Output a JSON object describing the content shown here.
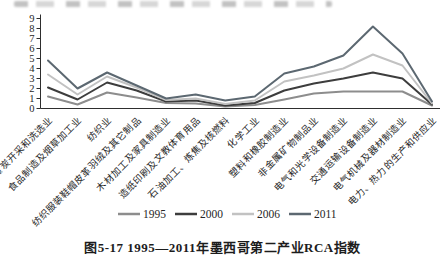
{
  "figure": {
    "caption": "图5-17 1995—2011年墨西哥第二产业RCA指数"
  },
  "chart_data": {
    "type": "line",
    "title": "",
    "xlabel": "",
    "ylabel": "",
    "ylim": [
      0,
      9
    ],
    "yticks": [
      0,
      1,
      2,
      3,
      4,
      5,
      6,
      7,
      8,
      9
    ],
    "grid": false,
    "legend_position": "bottom",
    "axis_color": "#2e2e2e",
    "categories": [
      "煤炭开采和洗选业",
      "食品制造及烟草加工业",
      "纺织业",
      "纺织服装鞋帽皮革羽绒及其它制品",
      "木材加工及家具制造业",
      "造纸印刷及文教体育用品",
      "石油加工、炼焦及核燃料",
      "化学工业",
      "塑料和橡胶制造业",
      "非金属矿物制品业",
      "电气和光学设备制造业",
      "交通运输设备制造业",
      "电气机械及器材制造业",
      "电力、热力的生产和供应业"
    ],
    "series": [
      {
        "name": "1995",
        "color": "#8d8d8d",
        "values": [
          1.2,
          0.4,
          1.6,
          1.1,
          0.55,
          0.5,
          0.2,
          0.35,
          0.9,
          1.5,
          1.7,
          1.7,
          1.7,
          0.3
        ]
      },
      {
        "name": "2000",
        "color": "#3d3d3d",
        "values": [
          2.1,
          0.9,
          2.6,
          1.8,
          0.7,
          0.8,
          0.3,
          0.55,
          1.8,
          2.5,
          3.0,
          3.6,
          3.0,
          0.4
        ]
      },
      {
        "name": "2006",
        "color": "#c2c2c2",
        "values": [
          3.4,
          1.4,
          3.2,
          2.1,
          0.85,
          1.0,
          0.45,
          0.8,
          2.7,
          3.3,
          4.0,
          5.4,
          4.3,
          0.5
        ]
      },
      {
        "name": "2011",
        "color": "#5c6871",
        "values": [
          4.8,
          2.0,
          3.6,
          2.3,
          1.0,
          1.4,
          0.8,
          1.2,
          3.5,
          4.2,
          5.3,
          8.2,
          5.5,
          0.7
        ]
      }
    ]
  }
}
